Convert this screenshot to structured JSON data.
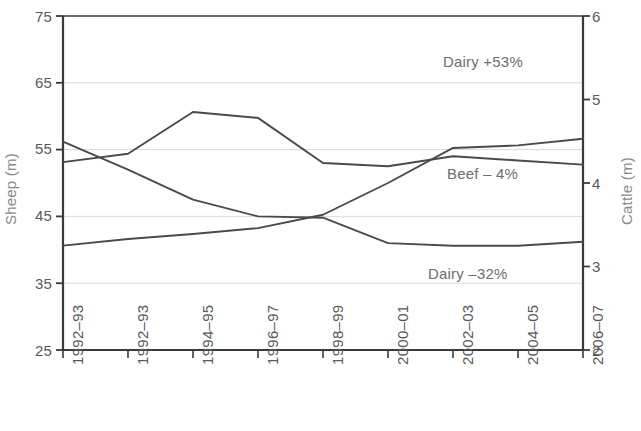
{
  "chart_data": {
    "type": "line",
    "title": "",
    "xlabel": "",
    "ylabel": "Sheep (m)",
    "ylabel_right": "Cattle (m)",
    "categories": [
      "1992–93",
      "1992–93",
      "1994–95",
      "1996–97",
      "1998–99",
      "2000–01",
      "2002–03",
      "2004–05",
      "2006–07"
    ],
    "ylim": [
      25,
      75
    ],
    "yticks": [
      25,
      35,
      45,
      55,
      65,
      75
    ],
    "ylim_right": [
      2,
      6
    ],
    "yticks_right": [
      2,
      3,
      4,
      5,
      6
    ],
    "grid": true,
    "grid_axis": "y",
    "legend_position": "inline-annotations",
    "series": [
      {
        "name": "Beef",
        "axis": "right",
        "annotation": "Beef – 4%",
        "values": [
          4.25,
          4.35,
          4.85,
          4.78,
          4.24,
          4.2,
          4.32,
          4.27,
          4.22
        ]
      },
      {
        "name": "Dairy rising",
        "axis": "right",
        "annotation": "Dairy +53%",
        "values": [
          3.25,
          3.33,
          3.39,
          3.46,
          3.62,
          4.0,
          4.42,
          4.45,
          4.53
        ]
      },
      {
        "name": "Sheep declining",
        "axis": "left",
        "annotation": "Dairy –32%",
        "values": [
          56.2,
          52.0,
          47.5,
          45.0,
          44.8,
          41.0,
          40.6,
          40.6,
          41.2
        ]
      }
    ],
    "annotations": [
      {
        "text": "Dairy +53%",
        "x_pct": 0.72,
        "y_value": 66.5
      },
      {
        "text": "Beef – 4%",
        "x_pct": 0.72,
        "y_value": 49.5
      },
      {
        "text": "Dairy –32%",
        "x_pct": 0.7,
        "y_value": 34.0
      }
    ]
  },
  "axes": {
    "left": {
      "title": "Sheep (m)",
      "ticks": [
        "25",
        "35",
        "45",
        "55",
        "65",
        "75"
      ]
    },
    "right": {
      "title": "Cattle (m)",
      "ticks": [
        "2",
        "3",
        "4",
        "5",
        "6"
      ]
    },
    "x": {
      "ticks": [
        "1992–93",
        "1992–93",
        "1994–95",
        "1996–97",
        "1998–99",
        "2000–01",
        "2002–03",
        "2004–05",
        "2006–07"
      ]
    }
  },
  "annotations": {
    "dairy_up": "Dairy +53%",
    "beef": "Beef – 4%",
    "dairy_down": "Dairy –32%"
  },
  "colors": {
    "line": "#4a4a4a",
    "axis": "#3a3a3a",
    "grid": "#d9d9d9",
    "text": "#595959",
    "axis_title": "#8a8a8a"
  }
}
